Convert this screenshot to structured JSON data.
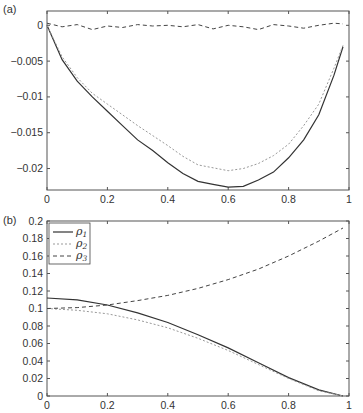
{
  "chart_data": [
    {
      "panel": "(a)",
      "type": "line",
      "title": "",
      "xlabel": "",
      "ylabel": "",
      "xlim": [
        0,
        1
      ],
      "ylim": [
        -0.023,
        0.002
      ],
      "xticks": [
        "0",
        "0.2",
        "0.4",
        "0.6",
        "0.8",
        "1"
      ],
      "yticks": [
        "0",
        "-0.005",
        "-0.01",
        "-0.015",
        "-0.02"
      ],
      "grid": false,
      "x": [
        0,
        0.05,
        0.1,
        0.15,
        0.2,
        0.25,
        0.3,
        0.35,
        0.4,
        0.45,
        0.5,
        0.55,
        0.6,
        0.65,
        0.7,
        0.75,
        0.8,
        0.85,
        0.9,
        0.95,
        0.98
      ],
      "series": [
        {
          "name": "solid",
          "style": "solid",
          "values": [
            0,
            -0.0048,
            -0.0078,
            -0.01,
            -0.012,
            -0.014,
            -0.016,
            -0.0175,
            -0.0192,
            -0.0207,
            -0.0218,
            -0.0222,
            -0.0226,
            -0.0225,
            -0.0216,
            -0.0205,
            -0.0185,
            -0.016,
            -0.0125,
            -0.007,
            -0.003
          ]
        },
        {
          "name": "dotted",
          "style": "dotted",
          "values": [
            0,
            -0.0044,
            -0.0073,
            -0.0095,
            -0.011,
            -0.0125,
            -0.014,
            -0.0154,
            -0.0168,
            -0.0183,
            -0.0195,
            -0.0199,
            -0.0203,
            -0.02,
            -0.0193,
            -0.0182,
            -0.0166,
            -0.014,
            -0.011,
            -0.006,
            -0.0028
          ]
        },
        {
          "name": "dashed",
          "style": "dashed",
          "values": [
            0.0003,
            -0.0002,
            0.0001,
            -0.0006,
            -0.0001,
            -0.0003,
            0.0001,
            -0.0001,
            0.0,
            -0.0002,
            0.0001,
            -0.0005,
            0.0,
            -0.0002,
            -0.0006,
            0.0001,
            -0.0001,
            -0.0004,
            0.0,
            0.0003,
            0.0002
          ]
        }
      ]
    },
    {
      "panel": "(b)",
      "type": "line",
      "title": "",
      "xlabel": "",
      "ylabel": "",
      "xlim": [
        0,
        1
      ],
      "ylim": [
        0,
        0.2
      ],
      "xticks": [
        "0",
        "0.2",
        "0.4",
        "0.6",
        "0.8",
        "1"
      ],
      "yticks": [
        "0",
        "0.02",
        "0.04",
        "0.06",
        "0.08",
        "0.1",
        "0.12",
        "0.14",
        "0.16",
        "0.18",
        "0.2"
      ],
      "grid": false,
      "legend": {
        "position": "upper left",
        "entries": [
          "ρ1",
          "ρ2",
          "ρ3"
        ]
      },
      "x": [
        0,
        0.1,
        0.2,
        0.3,
        0.4,
        0.5,
        0.6,
        0.7,
        0.8,
        0.9,
        0.98
      ],
      "series": [
        {
          "name": "ρ1",
          "style": "solid",
          "values": [
            0.112,
            0.11,
            0.104,
            0.095,
            0.084,
            0.07,
            0.055,
            0.038,
            0.021,
            0.007,
            0.0
          ]
        },
        {
          "name": "ρ2",
          "style": "dotted",
          "values": [
            0.1,
            0.098,
            0.094,
            0.087,
            0.078,
            0.066,
            0.052,
            0.036,
            0.02,
            0.006,
            0.0
          ]
        },
        {
          "name": "ρ3",
          "style": "dashed",
          "values": [
            0.1,
            0.101,
            0.104,
            0.109,
            0.115,
            0.123,
            0.133,
            0.145,
            0.16,
            0.177,
            0.192
          ]
        }
      ]
    }
  ],
  "labels": {
    "panel_a": "(a)",
    "panel_b": "(b)",
    "legend": [
      {
        "base": "ρ",
        "sub": "1"
      },
      {
        "base": "ρ",
        "sub": "2"
      },
      {
        "base": "ρ",
        "sub": "3"
      }
    ]
  }
}
